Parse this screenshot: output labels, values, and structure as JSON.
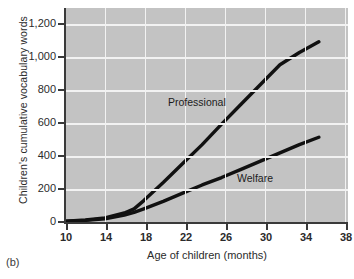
{
  "caption": "(b)",
  "chart_data": {
    "type": "line",
    "title": "",
    "xlabel": "Age of children (months)",
    "ylabel": "Children's cumulative vocabulary words",
    "xlim": [
      10,
      39
    ],
    "ylim": [
      0,
      1300
    ],
    "xticks": [
      10,
      14,
      18,
      22,
      26,
      30,
      34,
      38
    ],
    "xtick_labels": [
      "10",
      "14",
      "18",
      "22",
      "26",
      "30",
      "34",
      "38"
    ],
    "yticks": [
      0,
      200,
      400,
      600,
      800,
      1000,
      1200
    ],
    "ytick_labels": [
      "0",
      "200",
      "400",
      "600",
      "800",
      "1,000",
      "1,200"
    ],
    "grid": true,
    "grid_color": "#f2f2f2",
    "plot_background": "#c3c3c3",
    "line_color": "#111111",
    "legend": "annotated-inline",
    "series": [
      {
        "name": "Professional",
        "x": [
          10,
          12,
          14,
          16,
          17,
          18,
          20,
          22,
          24,
          26,
          28,
          30,
          32,
          34,
          36
        ],
        "values": [
          5,
          12,
          25,
          55,
          80,
          130,
          240,
          355,
          470,
          595,
          715,
          835,
          955,
          1030,
          1095
        ]
      },
      {
        "name": "Welfare",
        "x": [
          10,
          12,
          14,
          16,
          17,
          18,
          20,
          22,
          24,
          26,
          28,
          30,
          32,
          34,
          36
        ],
        "values": [
          5,
          10,
          20,
          42,
          58,
          80,
          125,
          175,
          225,
          270,
          320,
          370,
          420,
          470,
          515
        ]
      }
    ],
    "annotations": [
      {
        "text": "Professional",
        "x": 21.5,
        "y": 690
      },
      {
        "text": "Welfare",
        "x": 28.5,
        "y": 300
      }
    ]
  }
}
